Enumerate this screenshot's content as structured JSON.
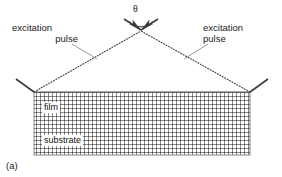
{
  "figure": {
    "panel_label": "(a)",
    "angle_symbol": "θ",
    "excitation_left": {
      "line_1": "excitation",
      "line_2": "pulse"
    },
    "excitation_right": {
      "line_1": "excitation",
      "line_2": "pulse"
    },
    "layers": {
      "film": "film",
      "substrate": "substrate"
    },
    "colors": {
      "line": "#4d4d4d",
      "grid": "#7f7f7f",
      "text": "#1a1a1a",
      "background": "#ffffff"
    },
    "geometry": {
      "vertex_x": 141,
      "vertex_y": 30,
      "surface_left_x": 34,
      "surface_right_x": 250,
      "surface_y": 92,
      "block_bottom_y": 155,
      "grid_spacing_px": 4
    }
  }
}
